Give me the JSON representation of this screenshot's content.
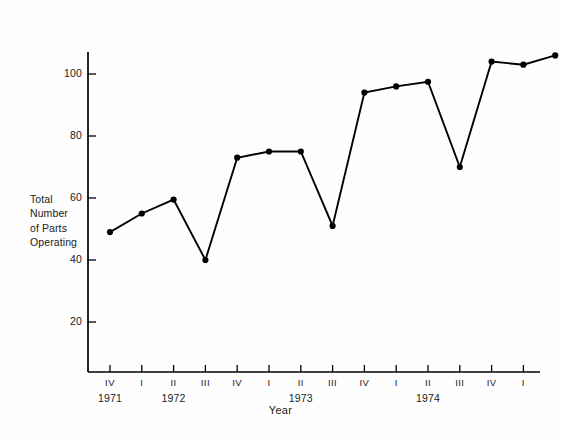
{
  "chart_data": {
    "type": "line",
    "title": "",
    "xlabel": "Year",
    "ylabel": "Total Number of Parts Operating",
    "ylabel_lines": [
      "Total",
      "Number",
      "of Parts",
      "Operating"
    ],
    "ylim": [
      0,
      112
    ],
    "yticks": [
      20,
      40,
      60,
      80,
      100
    ],
    "ytick_labels": [
      "20",
      "40",
      "60",
      "80",
      "100"
    ],
    "grid": false,
    "legend": false,
    "marker": "filled-circle",
    "line_color": "#000000",
    "marker_color": "#000000",
    "axis_color": "#000000",
    "background_color": "#fefefe",
    "categories": [
      "1971 IV",
      "1972 I",
      "1972 II",
      "1972 III",
      "1972 IV",
      "1973 I",
      "1973 II",
      "1973 III",
      "1973 IV",
      "1974 I",
      "1974 II",
      "1974 III",
      "1974 IV",
      "1975 I",
      "1975 II"
    ],
    "xtick_labels": [
      "IV",
      "I",
      "II",
      "III",
      "IV",
      "I",
      "II",
      "III",
      "IV",
      "I",
      "II",
      "III",
      "IV",
      "I",
      "II"
    ],
    "year_labels": [
      "1971",
      "1972",
      "1973",
      "1974"
    ],
    "year_label_index": [
      0,
      2,
      6,
      10
    ],
    "values": [
      49,
      55,
      59.5,
      40,
      73,
      75,
      75,
      51,
      94,
      96,
      97.5,
      70,
      104,
      103,
      106
    ]
  }
}
